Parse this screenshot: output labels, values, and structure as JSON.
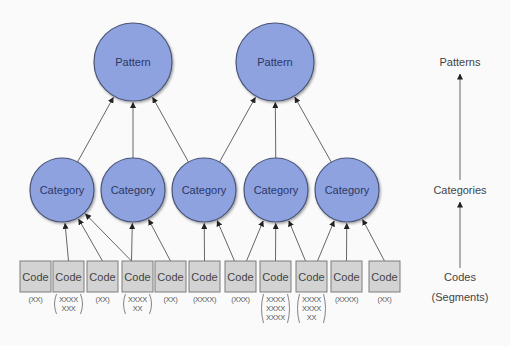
{
  "colors": {
    "background": "#fafafa",
    "node_fill": "#8ea2df",
    "node_stroke": "#4a5578",
    "node_text": "#2b3766",
    "code_fill": "#d3d3d3",
    "code_stroke": "#7d7d7d",
    "edge": "#555555"
  },
  "patterns": [
    {
      "label": "Pattern",
      "cx": 133,
      "cy": 62,
      "r": 39
    },
    {
      "label": "Pattern",
      "cx": 275,
      "cy": 62,
      "r": 39
    }
  ],
  "categories": [
    {
      "label": "Category",
      "cx": 62,
      "cy": 190,
      "r": 32,
      "pattern": 0
    },
    {
      "label": "Category",
      "cx": 133,
      "cy": 190,
      "r": 32,
      "pattern": 0
    },
    {
      "label": "Category",
      "cx": 204,
      "cy": 190,
      "r": 32,
      "pattern": [
        0,
        1
      ]
    },
    {
      "label": "Category",
      "cx": 276,
      "cy": 190,
      "r": 32,
      "pattern": 1
    },
    {
      "label": "Category",
      "cx": 347,
      "cy": 190,
      "r": 32,
      "pattern": 1
    }
  ],
  "codes": [
    {
      "label": "Code",
      "x": 20,
      "segments": [
        "(XX)"
      ],
      "categories": []
    },
    {
      "label": "Code",
      "x": 53,
      "segments": [
        "XXXX",
        "XXX"
      ],
      "categories": [
        0
      ]
    },
    {
      "label": "Code",
      "x": 87,
      "segments": [
        "(XX)"
      ],
      "categories": [
        0
      ]
    },
    {
      "label": "Code",
      "x": 122,
      "segments": [
        "XXXX",
        "XX"
      ],
      "categories": [
        0,
        1
      ]
    },
    {
      "label": "Code",
      "x": 155,
      "segments": [
        "(XX)"
      ],
      "categories": [
        1
      ]
    },
    {
      "label": "Code",
      "x": 189,
      "segments": [
        "(XXXX)"
      ],
      "categories": [
        2
      ]
    },
    {
      "label": "Code",
      "x": 225,
      "segments": [
        "(XXX)"
      ],
      "categories": [
        2,
        3
      ]
    },
    {
      "label": "Code",
      "x": 260,
      "segments": [
        "XXXX",
        "XXXX",
        "XXXX"
      ],
      "categories": [
        3
      ]
    },
    {
      "label": "Code",
      "x": 296,
      "segments": [
        "XXXX",
        "XXXX",
        "XX"
      ],
      "categories": [
        3,
        4
      ]
    },
    {
      "label": "Code",
      "x": 331,
      "segments": [
        "(XXXX)"
      ],
      "categories": [
        4
      ]
    },
    {
      "label": "Code",
      "x": 369,
      "segments": [
        "(XX)"
      ],
      "categories": [
        4
      ]
    }
  ],
  "code_box": {
    "y": 261,
    "width": 31,
    "height": 31
  },
  "levels": {
    "patterns": "Patterns",
    "categories": "Categories",
    "codes": "Codes",
    "segments": "(Segments)"
  }
}
